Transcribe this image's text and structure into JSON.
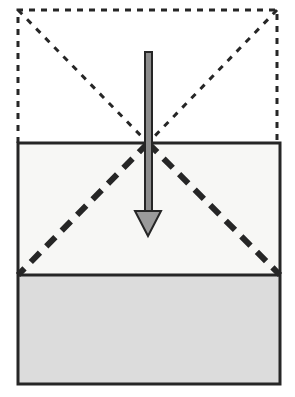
{
  "figure": {
    "canvas": {
      "width": 295,
      "height": 397,
      "background": "#ffffff"
    }
  },
  "colors": {
    "stroke_dark": "#262626",
    "upper_region_fill": "#f7f7f5",
    "lower_region_fill": "#dcdcdc",
    "top_region_fill": "#ffffff",
    "arrow_shaft_fill": "#8c8c8c",
    "arrow_head_fill": "#9a9a9a"
  },
  "shapes": {
    "dashed_outer_rectangle": {
      "name": "dashed-outer-rectangle",
      "x": 18,
      "y": 10,
      "width": 259,
      "height": 133,
      "fill": "#ffffff",
      "stroke": "#262626",
      "stroke_width": 3,
      "dash": "6 6",
      "edges_drawn": "top,left,right"
    },
    "solid_rectangle": {
      "name": "solid-outer-rectangle",
      "x": 18,
      "y": 143,
      "width": 262,
      "height": 241,
      "fill": "none",
      "stroke": "#262626",
      "stroke_width": 3
    },
    "upper_region": {
      "name": "upper-region",
      "x": 18,
      "y": 143,
      "width": 262,
      "height": 132,
      "fill": "#f7f7f5"
    },
    "lower_region": {
      "name": "lower-region",
      "x": 18,
      "y": 275,
      "width": 262,
      "height": 109,
      "fill": "#dcdcdc"
    },
    "divider_line": {
      "name": "horizontal-divider-line",
      "x1": 18,
      "y1": 275,
      "x2": 280,
      "y2": 275,
      "stroke": "#262626",
      "stroke_width": 3
    }
  },
  "diagonals": {
    "upper_thin": [
      {
        "name": "thin-diagonal-left",
        "x1": 18,
        "y1": 10,
        "x2": 148,
        "y2": 143,
        "stroke": "#262626",
        "stroke_width": 3,
        "dash": "6 7"
      },
      {
        "name": "thin-diagonal-right",
        "x1": 277,
        "y1": 10,
        "x2": 148,
        "y2": 143,
        "stroke": "#262626",
        "stroke_width": 3,
        "dash": "6 7"
      }
    ],
    "lower_thick": [
      {
        "name": "thick-diagonal-left",
        "x1": 148,
        "y1": 143,
        "x2": 18,
        "y2": 275,
        "stroke": "#262626",
        "stroke_width": 6,
        "dash": "13 9"
      },
      {
        "name": "thick-diagonal-right",
        "x1": 148,
        "y1": 143,
        "x2": 280,
        "y2": 275,
        "stroke": "#262626",
        "stroke_width": 6,
        "dash": "13 9"
      }
    ]
  },
  "arrow": {
    "name": "downward-arrow",
    "direction": "down",
    "shaft": {
      "x": 145,
      "y": 52,
      "width": 7,
      "height": 162,
      "fill": "#8c8c8c",
      "stroke": "#262626",
      "stroke_width": 2
    },
    "head": {
      "tip_x": 148,
      "tip_y": 236,
      "base_y": 211,
      "half_width": 13,
      "fill": "#9a9a9a",
      "stroke": "#262626",
      "stroke_width": 2
    }
  },
  "labels": {
    "none_visible": ""
  }
}
